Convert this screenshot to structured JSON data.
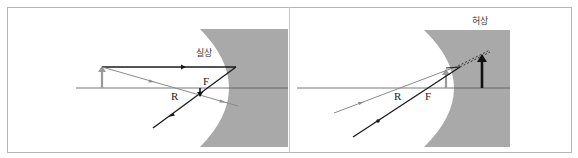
{
  "diagram": {
    "colors": {
      "mirror_fill": "#a9a9a9",
      "axis": "#555555",
      "ray_dark": "#1a1a1a",
      "ray_gray": "#8a8a8a",
      "object_arrow": "#9a9a9a",
      "image_arrow": "#111111",
      "frame": "#b5b5b5"
    },
    "panels": [
      {
        "id": "left",
        "caption": "실상",
        "point_labels": {
          "focus": "F",
          "center": "R"
        },
        "object": {
          "type": "arrow",
          "color": "gray",
          "direction": "up"
        },
        "image": {
          "type": "arrow",
          "color": "black",
          "direction": "down",
          "kind": "real"
        }
      },
      {
        "id": "right",
        "caption": "허상",
        "point_labels": {
          "focus": "F",
          "center": "R"
        },
        "object": {
          "type": "arrow",
          "color": "gray",
          "direction": "up"
        },
        "image": {
          "type": "arrow",
          "color": "black",
          "direction": "up",
          "kind": "virtual"
        }
      }
    ]
  }
}
